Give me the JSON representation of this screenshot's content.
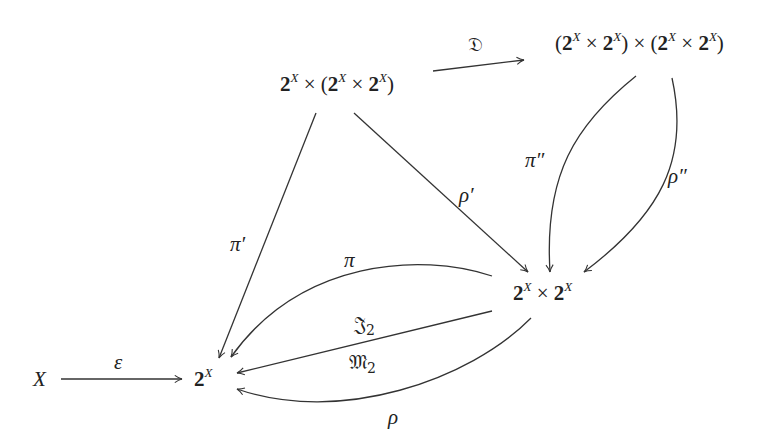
{
  "diagram": {
    "type": "commutative-diagram",
    "nodes": {
      "X": {
        "text": "X"
      },
      "P": {
        "base": "2",
        "exp": "X"
      },
      "PxP": {
        "parts": [
          "2",
          "X",
          "×",
          "2",
          "X"
        ]
      },
      "P_x_PP": {
        "text": "2^X × (2^X × 2^X)"
      },
      "PP_x_PP": {
        "text": "(2^X × 2^X) × (2^X × 2^X)"
      }
    },
    "arrows": [
      {
        "id": "epsilon",
        "from": "X",
        "to": "2^X",
        "label": "ε"
      },
      {
        "id": "D",
        "from": "2^X × (2^X × 2^X)",
        "to": "(2^X × 2^X) × (2^X × 2^X)",
        "label": "𝔇"
      },
      {
        "id": "pi-prime",
        "from": "2^X × (2^X × 2^X)",
        "to": "2^X",
        "label": "π′"
      },
      {
        "id": "rho-prime",
        "from": "2^X × (2^X × 2^X)",
        "to": "2^X × 2^X",
        "label": "ρ′"
      },
      {
        "id": "pi-double-prime",
        "from": "(2^X × 2^X) × (2^X × 2^X)",
        "to": "2^X × 2^X",
        "label": "π″"
      },
      {
        "id": "rho-double-prime",
        "from": "(2^X × 2^X) × (2^X × 2^X)",
        "to": "2^X × 2^X",
        "label": "ρ″"
      },
      {
        "id": "pi",
        "from": "2^X × 2^X",
        "to": "2^X",
        "label": "π"
      },
      {
        "id": "J2",
        "from": "2^X × 2^X",
        "to": "2^X",
        "label": "𝔍",
        "sub": "2"
      },
      {
        "id": "M2",
        "from": "2^X × 2^X",
        "to": "2^X",
        "label": "𝔐",
        "sub": "2"
      },
      {
        "id": "rho",
        "from": "2^X × 2^X",
        "to": "2^X",
        "label": "ρ"
      }
    ],
    "labels": {
      "two": "2",
      "exp": "X",
      "times": "×",
      "lparen": "(",
      "rparen": ")",
      "X": "X",
      "epsilon": "ε",
      "D": "𝔇",
      "pi_prime": "π′",
      "rho_prime": "ρ′",
      "pi_dprime": "π″",
      "rho_dprime": "ρ″",
      "pi": "π",
      "J": "𝔍",
      "M": "𝔐",
      "sub2": "2",
      "rho": "ρ"
    },
    "stroke_color": "#333333"
  }
}
